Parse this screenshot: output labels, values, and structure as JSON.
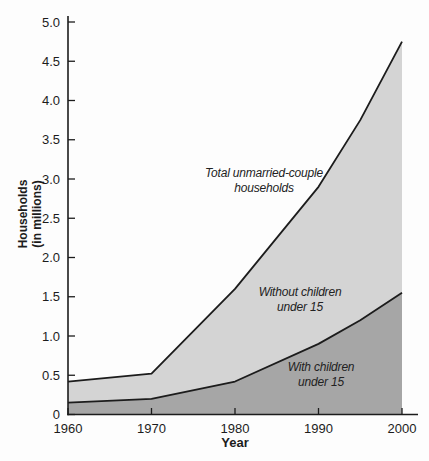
{
  "chart_data": {
    "type": "area",
    "title": "",
    "xlabel": "Year",
    "ylabel": "Households (in millions)",
    "ylabel_lines": {
      "line1": "Households",
      "line2": "(in millions)"
    },
    "x": [
      1960,
      1970,
      1980,
      1990,
      1995,
      2000
    ],
    "xlim": [
      1960,
      2000
    ],
    "ylim": [
      0,
      5.0
    ],
    "grid": false,
    "series": [
      {
        "name": "Total unmarried-couple households",
        "values": [
          0.42,
          0.52,
          1.6,
          2.9,
          3.75,
          4.75
        ],
        "fill_color": "#d4d4d4"
      },
      {
        "name": "With children under 15",
        "values": [
          0.15,
          0.2,
          0.42,
          0.9,
          1.2,
          1.55
        ],
        "fill_color": "#a6a6a6"
      }
    ],
    "line_color": "#1c1c1c",
    "axis_color": "#1c1c1c",
    "x_ticks": [
      {
        "value": 1960,
        "label": "1960"
      },
      {
        "value": 1970,
        "label": "1970"
      },
      {
        "value": 1980,
        "label": "1980"
      },
      {
        "value": 1990,
        "label": "1990"
      },
      {
        "value": 2000,
        "label": "2000"
      }
    ],
    "y_ticks": [
      {
        "value": 0,
        "label": "0"
      },
      {
        "value": 0.5,
        "label": "0.5"
      },
      {
        "value": 1.0,
        "label": "1.0"
      },
      {
        "value": 1.5,
        "label": "1.5"
      },
      {
        "value": 2.0,
        "label": "2.0"
      },
      {
        "value": 2.5,
        "label": "2.5"
      },
      {
        "value": 3.0,
        "label": "3.0"
      },
      {
        "value": 3.5,
        "label": "3.5"
      },
      {
        "value": 4.0,
        "label": "4.0"
      },
      {
        "value": 4.5,
        "label": "4.5"
      },
      {
        "value": 5.0,
        "label": "5.0"
      }
    ],
    "annotations": {
      "total": {
        "line1": "Total unmarried-couple",
        "line2": "households"
      },
      "without": {
        "line1": "Without children",
        "line2": "under 15"
      },
      "with": {
        "line1": "With children",
        "line2": "under 15"
      }
    }
  }
}
